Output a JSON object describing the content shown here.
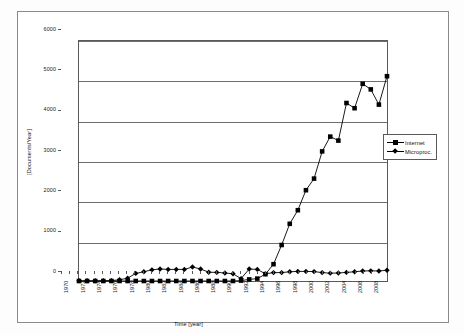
{
  "chart_data": {
    "type": "line",
    "title": "",
    "xlabel": "Time [year]",
    "ylabel": "[Documents/Year]",
    "xlim": [
      1970,
      2008
    ],
    "ylim": [
      0,
      6000
    ],
    "grid": true,
    "legend_position": "right",
    "y_ticks": [
      0,
      1000,
      2000,
      3000,
      4000,
      5000,
      6000
    ],
    "y_tick_labels": [
      "0",
      "1000",
      "2000",
      "3000",
      "4000",
      "5000",
      "6000"
    ],
    "x_ticks": [
      1970,
      1971,
      1972,
      1973,
      1974,
      1975,
      1976,
      1977,
      1978,
      1979,
      1980,
      1981,
      1982,
      1983,
      1984,
      1985,
      1986,
      1987,
      1988,
      1989,
      1990,
      1991,
      1992,
      1993,
      1994,
      1995,
      1996,
      1997,
      1998,
      1999,
      2000,
      2001,
      2002,
      2003,
      2004,
      2005,
      2006,
      2007,
      2008
    ],
    "x_tick_labels": [
      "1970",
      "1972",
      "1974",
      "1976",
      "1978",
      "1980",
      "1982",
      "1984",
      "1986",
      "1988",
      "1990",
      "1992",
      "1994",
      "1996",
      "1998",
      "2000",
      "2002",
      "2004",
      "2006",
      "2008"
    ],
    "x": [
      1970,
      1971,
      1972,
      1973,
      1974,
      1975,
      1976,
      1977,
      1978,
      1979,
      1980,
      1981,
      1982,
      1983,
      1984,
      1985,
      1986,
      1987,
      1988,
      1989,
      1990,
      1991,
      1992,
      1993,
      1994,
      1995,
      1996,
      1997,
      1998,
      1999,
      2000,
      2001,
      2002,
      2003,
      2004,
      2005,
      2006,
      2007,
      2008
    ],
    "series": [
      {
        "name": "Internet",
        "marker": "square",
        "color": "#000000",
        "values": [
          0,
          0,
          0,
          0,
          0,
          0,
          0,
          0,
          0,
          0,
          0,
          0,
          0,
          0,
          0,
          0,
          0,
          0,
          0,
          0,
          10,
          40,
          60,
          170,
          420,
          900,
          1430,
          1770,
          2270,
          2560,
          3240,
          3610,
          3510,
          4450,
          4320,
          4930,
          4790,
          4410,
          5120
        ]
      },
      {
        "name": "Microproc.",
        "marker": "diamond",
        "color": "#000000",
        "values": [
          5,
          5,
          5,
          8,
          10,
          30,
          70,
          190,
          230,
          280,
          300,
          290,
          290,
          290,
          350,
          300,
          220,
          215,
          200,
          180,
          60,
          300,
          290,
          180,
          210,
          210,
          230,
          240,
          240,
          235,
          210,
          195,
          200,
          215,
          230,
          250,
          255,
          250,
          270
        ]
      }
    ]
  },
  "legend": {
    "entries": [
      {
        "label": "Internet"
      },
      {
        "label": "Microproc."
      }
    ]
  },
  "axes": {
    "y_title": "[Documents/Year]",
    "x_title": "Time [year]"
  }
}
